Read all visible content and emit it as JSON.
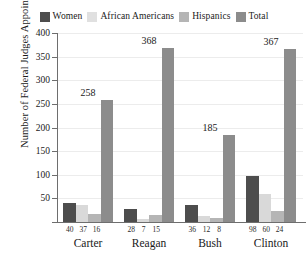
{
  "chart_data": {
    "type": "bar",
    "title": "",
    "xlabel": "",
    "ylabel": "Number of Federal Judges Appointed",
    "ylim": [
      0,
      400
    ],
    "yticks": [
      0,
      50,
      100,
      150,
      200,
      250,
      300,
      350,
      400
    ],
    "ytick_labels": [
      "",
      "50",
      "100",
      "150",
      "200",
      "250",
      "300",
      "350",
      "400"
    ],
    "grid": true,
    "legend_position": "top",
    "categories": [
      "Carter",
      "Reagan",
      "Bush",
      "Clinton"
    ],
    "series": [
      {
        "name": "Women",
        "color": "#4d4d4d",
        "values": [
          40,
          28,
          36,
          98
        ]
      },
      {
        "name": "African Americans",
        "color": "#d9d9d9",
        "values": [
          37,
          7,
          12,
          60
        ]
      },
      {
        "name": "Hispanics",
        "color": "#b5b5b5",
        "values": [
          16,
          15,
          8,
          24
        ]
      },
      {
        "name": "Total",
        "color": "#8c8c8c",
        "values": [
          258,
          368,
          185,
          367
        ]
      }
    ],
    "total_labels": [
      "258",
      "368",
      "185",
      "367"
    ]
  },
  "legend": {
    "entries": [
      {
        "label": "Women",
        "color": "#4d4d4d"
      },
      {
        "label": "African Americans",
        "color": "#e0e0e0"
      },
      {
        "label": "Hispanics",
        "color": "#b5b5b5"
      },
      {
        "label": "Total",
        "color": "#8c8c8c"
      }
    ]
  },
  "axes": {
    "y_title": "Number of Federal Judges Appointed",
    "y_labels": [
      "400",
      "350",
      "300",
      "250",
      "200",
      "150",
      "100",
      "50"
    ]
  },
  "groups": [
    {
      "name": "Carter",
      "total_label": "258",
      "sub_values": [
        "40",
        "37",
        "16"
      ]
    },
    {
      "name": "Reagan",
      "total_label": "368",
      "sub_values": [
        "28",
        "7",
        "15"
      ]
    },
    {
      "name": "Bush",
      "total_label": "185",
      "sub_values": [
        "36",
        "12",
        "8"
      ]
    },
    {
      "name": "Clinton",
      "total_label": "367",
      "sub_values": [
        "98",
        "60",
        "24"
      ]
    }
  ]
}
